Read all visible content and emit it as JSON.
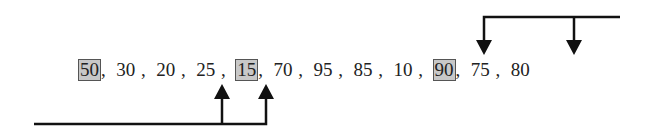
{
  "sequence": [
    {
      "value": "50",
      "highlighted": true
    },
    {
      "value": "30",
      "highlighted": false
    },
    {
      "value": "20",
      "highlighted": false
    },
    {
      "value": "25",
      "highlighted": false
    },
    {
      "value": "15",
      "highlighted": true
    },
    {
      "value": "70",
      "highlighted": false
    },
    {
      "value": "95",
      "highlighted": false
    },
    {
      "value": "85",
      "highlighted": false
    },
    {
      "value": "10",
      "highlighted": false
    },
    {
      "value": "90",
      "highlighted": true
    },
    {
      "value": "75",
      "highlighted": false
    },
    {
      "value": "80",
      "highlighted": false
    }
  ],
  "separator": ",",
  "arrows": {
    "top": {
      "from_direction": "right",
      "targets": [
        "90",
        "80"
      ],
      "direction": "down"
    },
    "bottom": {
      "from_direction": "left",
      "targets": [
        "25",
        "15"
      ],
      "direction": "up"
    }
  },
  "colors": {
    "highlight_fill": "#c8c8c8",
    "highlight_border": "#555555",
    "line": "#111111"
  }
}
